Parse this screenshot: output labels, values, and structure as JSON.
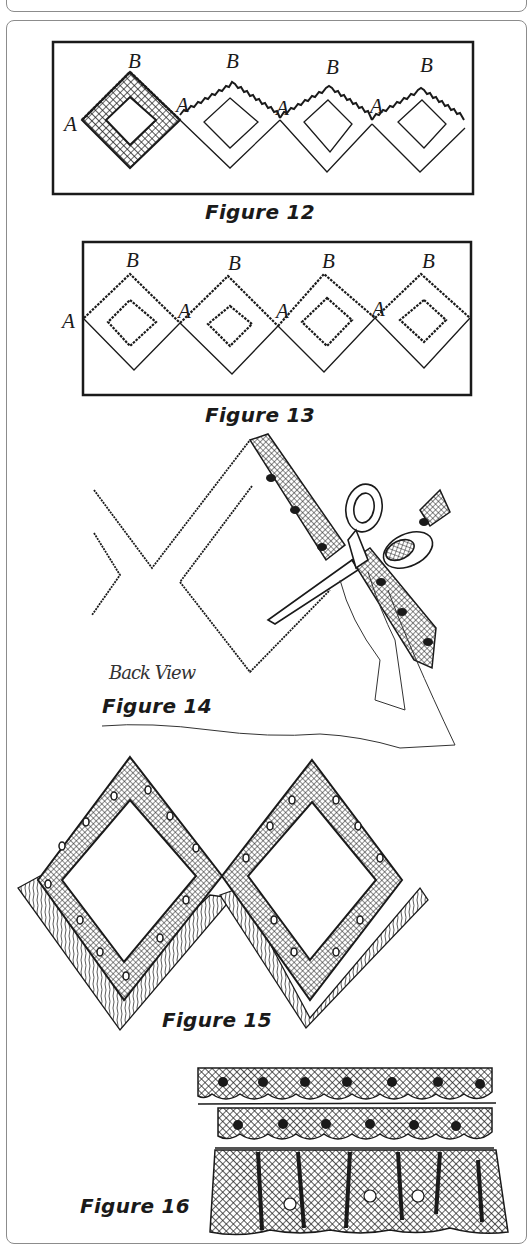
{
  "figures": [
    {
      "id": 12,
      "caption": "Figure 12",
      "labels": {
        "a": "A",
        "b": "B"
      }
    },
    {
      "id": 13,
      "caption": "Figure 13",
      "labels": {
        "a": "A",
        "b": "B"
      }
    },
    {
      "id": 14,
      "caption": "Figure 14",
      "subcaption": "Back View"
    },
    {
      "id": 15,
      "caption": "Figure 15"
    },
    {
      "id": 16,
      "caption": "Figure 16"
    }
  ],
  "colors": {
    "ink": "#1a1a1a",
    "border": "#8c8c8c",
    "paper": "#ffffff"
  }
}
